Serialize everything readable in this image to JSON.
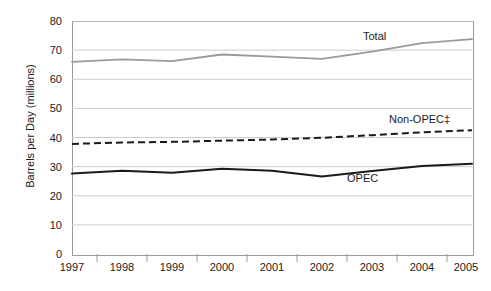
{
  "chart_data": {
    "type": "line",
    "title": "",
    "subtitle": "",
    "xlabel": "",
    "ylabel": "Barrels per Day (millions)",
    "categories": [
      "1997",
      "1998",
      "1999",
      "2000",
      "2001",
      "2002",
      "2003",
      "2004",
      "2005"
    ],
    "x": [
      1997,
      1998,
      1999,
      2000,
      2001,
      2002,
      2003,
      2004,
      2005
    ],
    "xlim": [
      1997,
      2005
    ],
    "ylim": [
      0,
      80
    ],
    "yticks": [
      0,
      10,
      20,
      30,
      40,
      50,
      60,
      70,
      80
    ],
    "ytick_labels": [
      "0",
      "10",
      "20",
      "30",
      "40",
      "50",
      "60",
      "70",
      "80"
    ],
    "grid": true,
    "grid_axis": "y",
    "legend_position": "inline-annotations",
    "series": [
      {
        "name": "Total",
        "label": "Total",
        "color": "#9a9a9a",
        "style": "solid",
        "width": 1.8,
        "values": [
          66.0,
          66.8,
          66.2,
          68.5,
          67.8,
          67.0,
          69.5,
          72.4,
          73.8
        ]
      },
      {
        "name": "Non-OPEC",
        "label": "Non-OPEC‡",
        "color": "#1a1a1a",
        "style": "dashed",
        "width": 2.0,
        "values": [
          37.8,
          38.3,
          38.5,
          38.9,
          39.3,
          39.9,
          40.8,
          41.8,
          42.5
        ]
      },
      {
        "name": "OPEC",
        "label": "OPEC",
        "color": "#1a1a1a",
        "style": "solid",
        "width": 2.0,
        "values": [
          27.6,
          28.6,
          27.9,
          29.3,
          28.6,
          26.6,
          28.5,
          30.2,
          31.0
        ]
      }
    ],
    "annotations": [
      {
        "text": "Total",
        "series": "Total"
      },
      {
        "text": "Non-OPEC‡",
        "series": "Non-OPEC"
      },
      {
        "text": "OPEC",
        "series": "OPEC"
      }
    ],
    "colors": {
      "total": "#9a9a9a",
      "non_opec": "#1a1a1a",
      "opec": "#1a1a1a",
      "gridline": "#cccccc",
      "frame": "#9a9a9a",
      "text": "#1a1a1a",
      "background": "#ffffff"
    }
  }
}
